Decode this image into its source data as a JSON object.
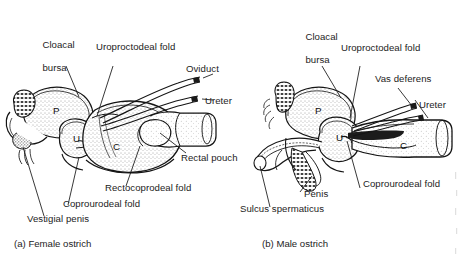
{
  "figure": {
    "kind": "anatomical-line-drawing",
    "panels": [
      {
        "id": "a",
        "caption": "(a) Female ostrich",
        "chambers": [
          {
            "code": "P",
            "name": "proctodeum"
          },
          {
            "code": "U",
            "name": "urodeum"
          },
          {
            "code": "C",
            "name": "coprodeum"
          }
        ],
        "labels": [
          {
            "name": "cloacal-bursa",
            "text": "Cloacal\nbursa"
          },
          {
            "name": "uroproctodeal-fold",
            "text": "Uroproctodeal fold"
          },
          {
            "name": "oviduct",
            "text": "Oviduct"
          },
          {
            "name": "ureter",
            "text": "Ureter"
          },
          {
            "name": "rectal-pouch",
            "text": "Rectal pouch"
          },
          {
            "name": "rectocoprodeal-fold",
            "text": "Rectocoprodeal fold"
          },
          {
            "name": "coprourodeal-fold",
            "text": "Coprourodeal fold"
          },
          {
            "name": "vestigial-penis",
            "text": "Vestigial penis"
          }
        ]
      },
      {
        "id": "b",
        "caption": "(b) Male ostrich",
        "chambers": [
          {
            "code": "P",
            "name": "proctodeum"
          },
          {
            "code": "U",
            "name": "urodeum"
          },
          {
            "code": "C",
            "name": "coprodeum"
          }
        ],
        "labels": [
          {
            "name": "cloacal-bursa",
            "text": "Cloacal\nbursa"
          },
          {
            "name": "uroproctodeal-fold",
            "text": "Uroproctodeal fold"
          },
          {
            "name": "vas-deferens",
            "text": "Vas deferens"
          },
          {
            "name": "ureter",
            "text": "Ureter"
          },
          {
            "name": "coprourodeal-fold",
            "text": "Coprourodeal fold"
          },
          {
            "name": "penis",
            "text": "Penis"
          },
          {
            "name": "sulcus-spermaticus",
            "text": "Sulcus spermaticus"
          }
        ]
      }
    ],
    "colors": {
      "ink": "#1a1a1a",
      "paper": "#ffffff",
      "fill": "#f2f0ee"
    }
  },
  "panel_a": {
    "caption": "(a) Female ostrich",
    "chamber_p": "P",
    "chamber_u": "U",
    "chamber_c": "C",
    "cloacal_bursa_l1": "Cloacal",
    "cloacal_bursa_l2": "bursa",
    "uroproctodeal_fold": "Uroproctodeal fold",
    "oviduct": "Oviduct",
    "ureter": "Ureter",
    "rectal_pouch": "Rectal pouch",
    "rectocoprodeal_fold": "Rectocoprodeal fold",
    "coprourodeal_fold": "Coprourodeal fold",
    "vestigial_penis": "Vestigial penis"
  },
  "panel_b": {
    "caption": "(b) Male ostrich",
    "chamber_p": "P",
    "chamber_u": "U",
    "chamber_c": "C",
    "cloacal_bursa_l1": "Cloacal",
    "cloacal_bursa_l2": "bursa",
    "uroproctodeal_fold": "Uroproctodeal fold",
    "vas_deferens": "Vas deferens",
    "ureter": "Ureter",
    "coprourodeal_fold": "Coprourodeal fold",
    "penis": "Penis",
    "sulcus_spermaticus": "Sulcus spermaticus"
  }
}
